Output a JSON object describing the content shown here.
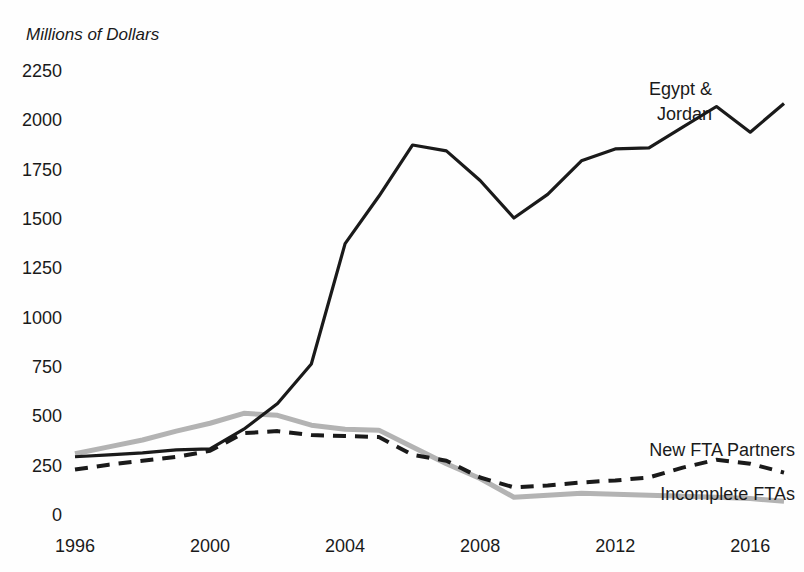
{
  "chart_data": {
    "type": "line",
    "title": "Millions of Dollars",
    "xlabel": "",
    "ylabel": "Millions of Dollars",
    "grid": false,
    "legend_position": "inline-annotations",
    "xlim": [
      1996,
      2017
    ],
    "ylim": [
      0,
      2250
    ],
    "x": [
      1996,
      1997,
      1998,
      1999,
      2000,
      2001,
      2002,
      2003,
      2004,
      2005,
      2006,
      2007,
      2008,
      2009,
      2010,
      2011,
      2012,
      2013,
      2014,
      2015,
      2016,
      2017
    ],
    "xticks": [
      1996,
      2000,
      2004,
      2008,
      2012,
      2016
    ],
    "xtick_labels": [
      "1996",
      "2000",
      "2004",
      "2008",
      "2012",
      "2016"
    ],
    "yticks": [
      0,
      250,
      500,
      750,
      1000,
      1250,
      1500,
      1750,
      2000,
      2250
    ],
    "ytick_labels": [
      "0",
      "250",
      "500",
      "750",
      "1000",
      "1250",
      "1500",
      "1750",
      "2000",
      "2250"
    ],
    "series": [
      {
        "name": "Egypt & Jordan",
        "label": "Egypt &\nJordan",
        "label_line1": "Egypt &",
        "label_line2": "Jordan",
        "style": "solid",
        "color": "#1a1a1a",
        "width": 3.2,
        "values": [
          290,
          300,
          310,
          325,
          330,
          430,
          560,
          760,
          1370,
          1610,
          1870,
          1840,
          1690,
          1500,
          1620,
          1790,
          1850,
          1855,
          1960,
          2065,
          1935,
          2080
        ]
      },
      {
        "name": "New FTA Partners",
        "label": "New FTA Partners",
        "style": "dashed",
        "color": "#1a1a1a",
        "width": 4,
        "dash": "13,9",
        "values": [
          225,
          250,
          270,
          290,
          320,
          410,
          420,
          400,
          395,
          390,
          300,
          270,
          185,
          135,
          145,
          160,
          170,
          185,
          235,
          275,
          255,
          210
        ]
      },
      {
        "name": "Incomplete FTAs",
        "label": "Incomplete FTAs",
        "style": "solid",
        "color": "#b3b3b3",
        "width": 5,
        "values": [
          305,
          340,
          375,
          420,
          460,
          510,
          500,
          450,
          430,
          425,
          340,
          255,
          180,
          85,
          95,
          105,
          100,
          95,
          90,
          85,
          78,
          65
        ]
      }
    ],
    "annotations": [
      {
        "text": "Egypt & Jordan",
        "x": 2014,
        "y": 2180
      },
      {
        "text": "New FTA Partners",
        "x": 2013,
        "y": 360
      },
      {
        "text": "Incomplete FTAs",
        "x": 2014,
        "y": 170
      }
    ]
  },
  "figure": {
    "background_color": "#fefefe",
    "text_color": "#1a1a1a",
    "accent_gray": "#b3b3b3"
  }
}
